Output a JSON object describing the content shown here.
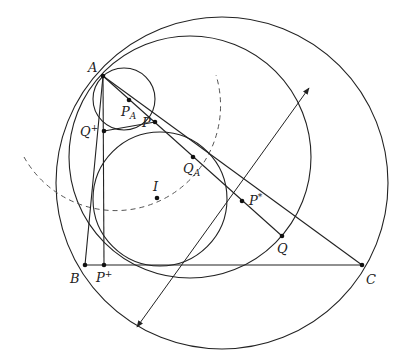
{
  "figure": {
    "width": 396,
    "height": 360,
    "stroke_color": "#222222",
    "background": "#ffffff"
  },
  "points": {
    "A": {
      "label": "A",
      "x": 103,
      "y": 76
    },
    "B": {
      "label": "B",
      "x": 85,
      "y": 265
    },
    "C": {
      "label": "C",
      "x": 362,
      "y": 265
    },
    "P_plus": {
      "label": "P",
      "sup": "+",
      "x": 104,
      "y": 265
    },
    "Q_plus": {
      "label": "Q",
      "sup": "+",
      "x": 104,
      "y": 131
    },
    "P": {
      "label": "P",
      "x": 155,
      "y": 122
    },
    "P_A": {
      "label": "P",
      "sub": "A",
      "x": 129,
      "y": 100
    },
    "Q_A": {
      "label": "Q",
      "sub": "A",
      "x": 193,
      "y": 157
    },
    "I": {
      "label": "I",
      "x": 157,
      "y": 198
    },
    "P_star": {
      "label": "P",
      "sup": "*",
      "x": 242,
      "y": 201
    },
    "Q": {
      "label": "Q",
      "x": 282,
      "y": 236
    }
  },
  "circles": [
    {
      "name": "circumcircle",
      "cx": 222,
      "cy": 183,
      "r": 166,
      "dashed": false
    },
    {
      "name": "circle-through-A-and-Q",
      "cx": 190,
      "cy": 157,
      "r": 121,
      "dashed": false
    },
    {
      "name": "incircle",
      "cx": 160,
      "cy": 199,
      "r": 67,
      "dashed": false
    },
    {
      "name": "small-circle-through-A",
      "cx": 124,
      "cy": 99,
      "r": 31,
      "dashed": false
    }
  ],
  "dashed_arc": {
    "name": "dashed-arc",
    "cx": 112,
    "cy": 88,
    "r": 105,
    "start": [
      24,
      157
    ],
    "end": [
      216,
      75
    ]
  },
  "segments": [
    {
      "name": "side-AB",
      "from": "A",
      "to": "B"
    },
    {
      "name": "side-BC",
      "from": "B",
      "to": "C"
    },
    {
      "name": "side-AC",
      "from": "A",
      "to": "C"
    },
    {
      "name": "altitude-A-Pplus",
      "from": "A",
      "to": "P_plus"
    },
    {
      "name": "segment-Qplus-P",
      "from": "Q_plus",
      "to": "P"
    },
    {
      "name": "segment-A-Q",
      "from": "A",
      "to": "Q"
    }
  ],
  "arrow_line": {
    "name": "double-arrow-through-Pstar",
    "x1": 137,
    "y1": 327,
    "x2": 309,
    "y2": 88
  }
}
